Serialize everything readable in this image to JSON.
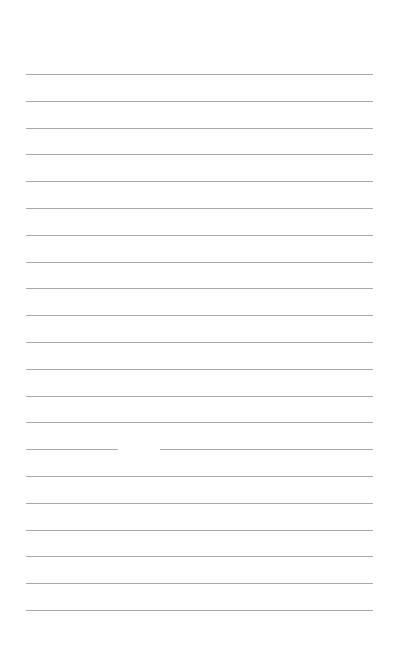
{
  "document": {
    "type": "lined-paper",
    "header_left": "",
    "header_right": "",
    "line_count": 21,
    "line_color": "#a8a8a8",
    "line_spacing_px": 26.8,
    "first_line_y": 74,
    "left_margin_px": 26,
    "right_margin_px": 29
  }
}
